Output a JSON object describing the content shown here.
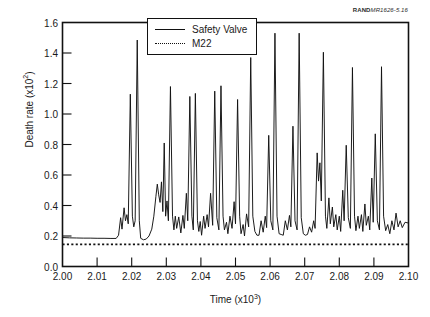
{
  "figure": {
    "source_credit_mark": "RAND",
    "source_credit_ref": "MR1626-5.16"
  },
  "chart_data": {
    "type": "line",
    "title": "",
    "xlabel": "Time (x10³)",
    "ylabel": "Death rate (x10²)",
    "xlim": [
      2.0,
      2.1
    ],
    "ylim": [
      0.0,
      1.6
    ],
    "xticks": [
      2.0,
      2.01,
      2.02,
      2.03,
      2.04,
      2.05,
      2.06,
      2.07,
      2.08,
      2.09,
      2.1
    ],
    "xtick_labels": [
      "2.00",
      "2.01",
      "2.02",
      "2.03",
      "2.04",
      "2.05",
      "2.06",
      "2.07",
      "2.08",
      "2.09",
      "2.10"
    ],
    "yticks": [
      0.0,
      0.2,
      0.4,
      0.6,
      0.8,
      1.0,
      1.2,
      1.4,
      1.6
    ],
    "ytick_labels": [
      "0.0",
      "0.2",
      "0.4",
      "0.6",
      "0.8",
      "1.0",
      "1.2",
      "1.4",
      "1.6"
    ],
    "grid": false,
    "legend_position": "top-center",
    "series": [
      {
        "name": "Safety Valve",
        "style": "solid",
        "color": "#111111",
        "points": [
          [
            2.0,
            0.19
          ],
          [
            2.002,
            0.188
          ],
          [
            2.004,
            0.187
          ],
          [
            2.006,
            0.186
          ],
          [
            2.008,
            0.186
          ],
          [
            2.01,
            0.185
          ],
          [
            2.012,
            0.185
          ],
          [
            2.014,
            0.184
          ],
          [
            2.0155,
            0.184
          ],
          [
            2.0162,
            0.205
          ],
          [
            2.0168,
            0.32
          ],
          [
            2.0172,
            0.245
          ],
          [
            2.0178,
            0.385
          ],
          [
            2.0182,
            0.3
          ],
          [
            2.0186,
            0.34
          ],
          [
            2.019,
            0.28
          ],
          [
            2.0196,
            1.13
          ],
          [
            2.0202,
            0.33
          ],
          [
            2.0206,
            0.26
          ],
          [
            2.021,
            0.3
          ],
          [
            2.0216,
            1.485
          ],
          [
            2.0222,
            0.3
          ],
          [
            2.0226,
            0.185
          ],
          [
            2.0234,
            0.175
          ],
          [
            2.0242,
            0.18
          ],
          [
            2.025,
            0.2
          ],
          [
            2.0258,
            0.245
          ],
          [
            2.0264,
            0.33
          ],
          [
            2.027,
            0.46
          ],
          [
            2.0274,
            0.54
          ],
          [
            2.0278,
            0.47
          ],
          [
            2.0282,
            0.42
          ],
          [
            2.0286,
            0.555
          ],
          [
            2.029,
            0.36
          ],
          [
            2.0294,
            0.81
          ],
          [
            2.0298,
            0.33
          ],
          [
            2.0302,
            0.43
          ],
          [
            2.0306,
            0.3
          ],
          [
            2.0312,
            1.18
          ],
          [
            2.0318,
            0.33
          ],
          [
            2.0322,
            0.24
          ],
          [
            2.0326,
            0.33
          ],
          [
            2.033,
            0.25
          ],
          [
            2.0336,
            0.325
          ],
          [
            2.0342,
            0.22
          ],
          [
            2.0348,
            0.335
          ],
          [
            2.0352,
            0.25
          ],
          [
            2.0358,
            0.48
          ],
          [
            2.0362,
            0.3
          ],
          [
            2.0368,
            1.115
          ],
          [
            2.0374,
            0.33
          ],
          [
            2.0378,
            0.24
          ],
          [
            2.0384,
            1.135
          ],
          [
            2.039,
            0.3
          ],
          [
            2.0394,
            0.23
          ],
          [
            2.0398,
            0.295
          ],
          [
            2.0402,
            0.205
          ],
          [
            2.0408,
            0.33
          ],
          [
            2.0412,
            0.25
          ],
          [
            2.0418,
            0.34
          ],
          [
            2.0422,
            0.26
          ],
          [
            2.0428,
            0.48
          ],
          [
            2.0434,
            0.27
          ],
          [
            2.044,
            1.15
          ],
          [
            2.0446,
            0.32
          ],
          [
            2.0452,
            0.24
          ],
          [
            2.0458,
            1.185
          ],
          [
            2.0464,
            0.33
          ],
          [
            2.0468,
            0.24
          ],
          [
            2.0474,
            0.29
          ],
          [
            2.0478,
            0.215
          ],
          [
            2.0484,
            0.33
          ],
          [
            2.049,
            0.25
          ],
          [
            2.0496,
            0.425
          ],
          [
            2.05,
            0.28
          ],
          [
            2.0506,
            1.095
          ],
          [
            2.0512,
            0.33
          ],
          [
            2.0516,
            0.215
          ],
          [
            2.0522,
            0.275
          ],
          [
            2.0526,
            0.2
          ],
          [
            2.0532,
            0.345
          ],
          [
            2.0538,
            0.26
          ],
          [
            2.0544,
            1.37
          ],
          [
            2.055,
            0.33
          ],
          [
            2.0556,
            0.23
          ],
          [
            2.0562,
            0.205
          ],
          [
            2.0568,
            0.205
          ],
          [
            2.0574,
            0.3
          ],
          [
            2.058,
            0.225
          ],
          [
            2.0586,
            0.33
          ],
          [
            2.059,
            0.255
          ],
          [
            2.0596,
            0.86
          ],
          [
            2.0602,
            0.3
          ],
          [
            2.0608,
            0.24
          ],
          [
            2.0614,
            1.53
          ],
          [
            2.062,
            0.33
          ],
          [
            2.0626,
            0.215
          ],
          [
            2.0632,
            0.21
          ],
          [
            2.0638,
            0.205
          ],
          [
            2.0644,
            0.3
          ],
          [
            2.065,
            0.24
          ],
          [
            2.0656,
            0.335
          ],
          [
            2.066,
            0.26
          ],
          [
            2.0666,
            0.92
          ],
          [
            2.0672,
            0.3
          ],
          [
            2.0678,
            0.24
          ],
          [
            2.0684,
            1.53
          ],
          [
            2.069,
            0.32
          ],
          [
            2.0696,
            0.215
          ],
          [
            2.0702,
            0.205
          ],
          [
            2.0708,
            0.21
          ],
          [
            2.0714,
            0.26
          ],
          [
            2.072,
            0.225
          ],
          [
            2.0726,
            0.3
          ],
          [
            2.073,
            0.25
          ],
          [
            2.0736,
            0.745
          ],
          [
            2.074,
            0.56
          ],
          [
            2.0744,
            0.68
          ],
          [
            2.0748,
            0.43
          ],
          [
            2.0754,
            1.405
          ],
          [
            2.076,
            0.33
          ],
          [
            2.0764,
            0.25
          ],
          [
            2.077,
            0.45
          ],
          [
            2.0774,
            0.28
          ],
          [
            2.078,
            0.39
          ],
          [
            2.0784,
            0.26
          ],
          [
            2.079,
            0.34
          ],
          [
            2.0794,
            0.24
          ],
          [
            2.08,
            0.33
          ],
          [
            2.0804,
            0.23
          ],
          [
            2.081,
            0.5
          ],
          [
            2.0814,
            0.3
          ],
          [
            2.082,
            0.795
          ],
          [
            2.0826,
            0.32
          ],
          [
            2.0832,
            0.25
          ],
          [
            2.0838,
            1.305
          ],
          [
            2.0844,
            0.33
          ],
          [
            2.0848,
            0.235
          ],
          [
            2.0854,
            0.33
          ],
          [
            2.0858,
            0.25
          ],
          [
            2.0864,
            0.34
          ],
          [
            2.0868,
            0.23
          ],
          [
            2.0874,
            0.41
          ],
          [
            2.0878,
            0.27
          ],
          [
            2.0884,
            0.33
          ],
          [
            2.0888,
            0.24
          ],
          [
            2.0894,
            0.58
          ],
          [
            2.0898,
            0.29
          ],
          [
            2.0904,
            0.87
          ],
          [
            2.091,
            0.3
          ],
          [
            2.0916,
            0.24
          ],
          [
            2.0922,
            1.31
          ],
          [
            2.0928,
            0.33
          ],
          [
            2.0934,
            0.235
          ],
          [
            2.094,
            0.275
          ],
          [
            2.0946,
            0.215
          ],
          [
            2.0952,
            0.3
          ],
          [
            2.0958,
            0.24
          ],
          [
            2.0964,
            0.35
          ],
          [
            2.097,
            0.26
          ],
          [
            2.0976,
            0.3
          ],
          [
            2.0982,
            0.255
          ],
          [
            2.099,
            0.29
          ],
          [
            2.1,
            0.285
          ]
        ]
      },
      {
        "name": "M22",
        "style": "dotted",
        "color": "#111111",
        "constant_value": 0.145,
        "points": [
          [
            2.0,
            0.145
          ],
          [
            2.1,
            0.145
          ]
        ]
      }
    ],
    "legend": [
      {
        "label": "Safety Valve",
        "style": "solid"
      },
      {
        "label": "M22",
        "style": "dotted"
      }
    ]
  }
}
